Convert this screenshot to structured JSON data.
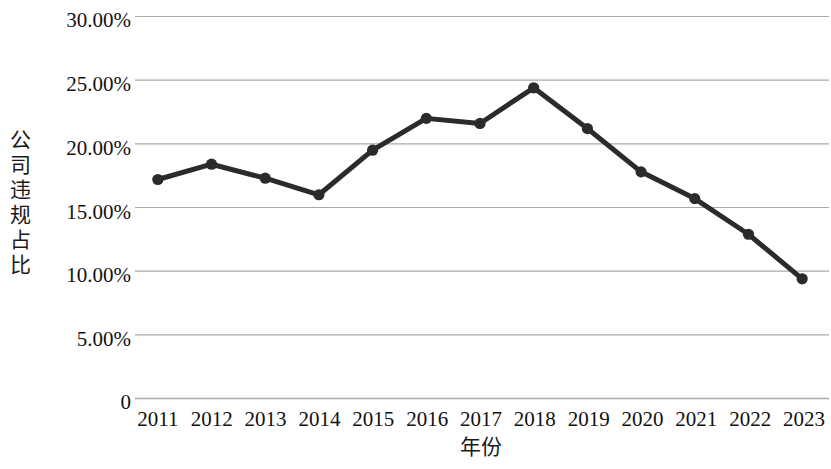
{
  "chart_data": {
    "type": "line",
    "title": "",
    "xlabel": "年份",
    "ylabel": "公司违规占比",
    "categories": [
      "2011",
      "2012",
      "2013",
      "2014",
      "2015",
      "2016",
      "2017",
      "2018",
      "2019",
      "2020",
      "2021",
      "2022",
      "2023"
    ],
    "values": [
      17.2,
      18.4,
      17.3,
      16.0,
      19.5,
      22.0,
      21.6,
      24.4,
      21.2,
      17.8,
      15.7,
      12.9,
      9.4
    ],
    "series": [
      {
        "name": "公司违规占比",
        "values": [
          17.2,
          18.4,
          17.3,
          16.0,
          19.5,
          22.0,
          21.6,
          24.4,
          21.2,
          17.8,
          15.7,
          12.9,
          9.4
        ]
      }
    ],
    "ylim": [
      0,
      30
    ],
    "ytick_values": [
      30,
      25,
      20,
      15,
      10,
      5,
      0
    ],
    "ytick_labels": [
      "30.00%",
      "25.00%",
      "20.00%",
      "15.00%",
      "10.00%",
      "5.00%",
      "0"
    ],
    "grid": "horizontal",
    "legend": "none",
    "line_color": "#2b2b2b",
    "marker_color": "#2b2b2b",
    "grid_color": "#aaaaaa",
    "background_color": "#ffffff"
  }
}
